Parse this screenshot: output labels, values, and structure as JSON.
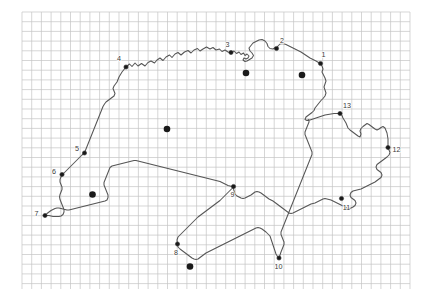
{
  "figure": {
    "background_color": "#ffffff",
    "outline_color": "#555555",
    "grid_color": "#bfbfbf",
    "marker_color": "#1a1a1a",
    "label_color": "#3a3a3a"
  },
  "grid": {
    "visible": true,
    "x_start": 22,
    "y_start": 12,
    "x_end": 410,
    "y_end": 289,
    "spacing": 9.7,
    "line_color": "#c4c4c4",
    "line_width": 0.7
  },
  "map_data": {
    "type": "map",
    "projection_units": "pixels",
    "outline_name": "switzerland-border",
    "numbered_markers": [
      {
        "id": "1",
        "label": "1",
        "x": 320.5,
        "y": 63.5,
        "label_x": 321.5,
        "label_y": 57.0,
        "label_anchor": "start"
      },
      {
        "id": "2",
        "label": "2",
        "x": 276.5,
        "y": 48.5,
        "label_x": 280.0,
        "label_y": 42.5,
        "label_anchor": "start"
      },
      {
        "id": "3",
        "label": "3",
        "x": 231.0,
        "y": 52.5,
        "label_x": 227.5,
        "label_y": 46.5,
        "label_anchor": "middle"
      },
      {
        "id": "4",
        "label": "4",
        "x": 126.0,
        "y": 67.0,
        "label_x": 119.0,
        "label_y": 61.0,
        "label_anchor": "middle"
      },
      {
        "id": "5",
        "label": "5",
        "x": 84.5,
        "y": 153.0,
        "label_x": 77.0,
        "label_y": 151.0,
        "label_anchor": "middle"
      },
      {
        "id": "6",
        "label": "6",
        "x": 62.0,
        "y": 174.5,
        "label_x": 54.0,
        "label_y": 173.5,
        "label_anchor": "middle"
      },
      {
        "id": "7",
        "label": "7",
        "x": 45.0,
        "y": 215.5,
        "label_x": 36.5,
        "label_y": 216.0,
        "label_anchor": "middle"
      },
      {
        "id": "8",
        "label": "8",
        "x": 177.5,
        "y": 244.0,
        "label_x": 176.0,
        "label_y": 254.5,
        "label_anchor": "middle"
      },
      {
        "id": "9",
        "label": "9",
        "x": 233.5,
        "y": 186.5,
        "label_x": 232.5,
        "label_y": 196.5,
        "label_anchor": "middle"
      },
      {
        "id": "10",
        "label": "10",
        "x": 279.0,
        "y": 258.0,
        "label_x": 278.5,
        "label_y": 269.0,
        "label_anchor": "middle"
      },
      {
        "id": "11",
        "label": "11",
        "x": 341.5,
        "y": 198.5,
        "label_x": 346.5,
        "label_y": 210.0,
        "label_anchor": "middle"
      },
      {
        "id": "12",
        "label": "12",
        "x": 388.0,
        "y": 147.5,
        "label_x": 392.5,
        "label_y": 152.0,
        "label_anchor": "start"
      },
      {
        "id": "13",
        "label": "13",
        "x": 340.0,
        "y": 113.5,
        "label_x": 347.0,
        "label_y": 108.0,
        "label_anchor": "middle"
      }
    ],
    "unlabeled_city_dots": [
      {
        "x": 246.0,
        "y": 73.0
      },
      {
        "x": 302.0,
        "y": 75.0
      },
      {
        "x": 167.0,
        "y": 129.0
      },
      {
        "x": 92.5,
        "y": 194.5
      },
      {
        "x": 190.0,
        "y": 266.5
      }
    ],
    "marker_radius_numbered": 2.1,
    "marker_radius_city": 3.3
  }
}
